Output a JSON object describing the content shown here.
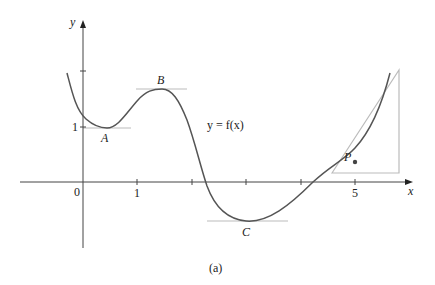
{
  "figure": {
    "caption": "(a)",
    "function_label": "y = f(x)",
    "axes": {
      "x_label": "x",
      "y_label": "y",
      "origin_label": "0",
      "x_tick_labels": [
        "1",
        "5"
      ],
      "y_tick_labels": [
        "1"
      ]
    },
    "points": {
      "A": "A",
      "B": "B",
      "C": "C",
      "P": "P"
    },
    "colors": {
      "curve": "#555555",
      "axes": "#444444",
      "tangent": "#bbbbbb"
    }
  }
}
